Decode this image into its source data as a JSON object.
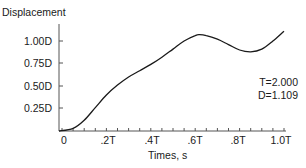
{
  "chart_data": {
    "type": "line",
    "title": "",
    "ylabel": "Displacement",
    "xlabel": "Times, s",
    "x_tick_labels": [
      "0",
      ".2T",
      ".4T",
      ".6T",
      ".8T",
      "1.0T"
    ],
    "x_ticks": [
      0,
      0.2,
      0.4,
      0.6,
      0.8,
      1.0
    ],
    "y_tick_labels": [
      "1.00D",
      "0.75D",
      "0.50D",
      "0.25D"
    ],
    "y_ticks": [
      1.0,
      0.75,
      0.5,
      0.25
    ],
    "xlim": [
      0,
      1.0
    ],
    "ylim": [
      0,
      1.109
    ],
    "grid": false,
    "legend": "none",
    "series": [
      {
        "name": "Displacement",
        "x": [
          0,
          0.05,
          0.1,
          0.15,
          0.2,
          0.25,
          0.3,
          0.35,
          0.4,
          0.45,
          0.5,
          0.55,
          0.6,
          0.62,
          0.65,
          0.7,
          0.75,
          0.8,
          0.85,
          0.9,
          0.95,
          1.0
        ],
        "values": [
          0.0,
          0.03,
          0.12,
          0.26,
          0.4,
          0.51,
          0.6,
          0.67,
          0.74,
          0.82,
          0.91,
          1.0,
          1.06,
          1.07,
          1.06,
          1.02,
          0.96,
          0.9,
          0.88,
          0.91,
          1.0,
          1.109
        ]
      }
    ],
    "annotations": [
      "T=2.000",
      "D=1.109"
    ],
    "colors": {
      "line": "#1a1a1a",
      "axis": "#555555",
      "text": "#1a1a1a"
    }
  },
  "labels": {
    "ytitle": "Displacement",
    "xtitle": "Times, s",
    "yticks": [
      "1.00D",
      "0.75D",
      "0.50D",
      "0.25D"
    ],
    "xticks": [
      "0",
      ".2T",
      ".4T",
      ".6T",
      ".8T",
      "1.0T"
    ],
    "period": "T=2.000",
    "max_disp": "D=1.109"
  }
}
